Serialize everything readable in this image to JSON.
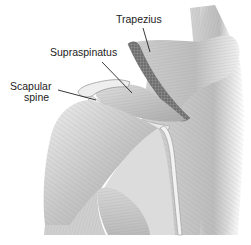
{
  "figure": {
    "style": "grayscale medical illustration",
    "colors": {
      "background": "#ffffff",
      "muscle_light": "#e4e4e4",
      "muscle_mid": "#bdbdbd",
      "muscle_dark": "#8c8c8c",
      "cut_edge": "#6e6e6e",
      "label_text": "#222222",
      "leader_line": "#222222"
    },
    "labels": {
      "trapezius": "Trapezius",
      "supraspinatus": "Supraspinatus",
      "scapular_spine_line1": "Scapular",
      "scapular_spine_line2": "spine"
    }
  }
}
